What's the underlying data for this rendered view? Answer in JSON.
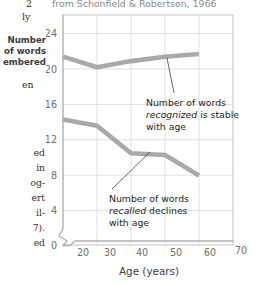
{
  "page": {
    "header_fragment": "from Schonfield & Robertson, 1966",
    "margin_caption_lines": [
      "Number",
      "of words",
      "embered"
    ],
    "margin_text_fragments_top": [
      "2",
      "ly",
      "en"
    ],
    "margin_text_fragments_bottom": [
      "ed",
      "in",
      "og-",
      "ert",
      "il-",
      "7).",
      "ed"
    ]
  },
  "chart_data": {
    "type": "line",
    "title": "",
    "subtitle": "",
    "xlabel": "Age (years)",
    "ylabel": "",
    "x": [
      20,
      30,
      40,
      50,
      60
    ],
    "xlim": [
      20,
      70
    ],
    "ylim": [
      0,
      26
    ],
    "xticks": [
      20,
      30,
      40,
      50,
      60,
      70
    ],
    "yticks": [
      0,
      4,
      8,
      12,
      16,
      20,
      24
    ],
    "grid": true,
    "legend": "none",
    "axis_break_x": true,
    "series": [
      {
        "name": "Number of words recognized",
        "values": [
          21.3,
          20.1,
          20.8,
          21.3,
          21.6
        ],
        "color": "#a9a9a9"
      },
      {
        "name": "Number of words recalled",
        "values": [
          14.2,
          13.5,
          10.4,
          10.2,
          7.9
        ],
        "color": "#a9a9a9"
      }
    ],
    "annotations": [
      {
        "id": "recognized-annotation",
        "line1_a": "Number of words",
        "line2_em": "recognized",
        "line2_b": " is stable",
        "line3": "with age",
        "target_x": 50,
        "target_y": 21.3
      },
      {
        "id": "recalled-annotation",
        "line1_a": "Number of words",
        "line2_em": "recalled",
        "line2_b": " declines",
        "line3": "with age",
        "target_x": 45,
        "target_y": 10.3
      }
    ]
  }
}
